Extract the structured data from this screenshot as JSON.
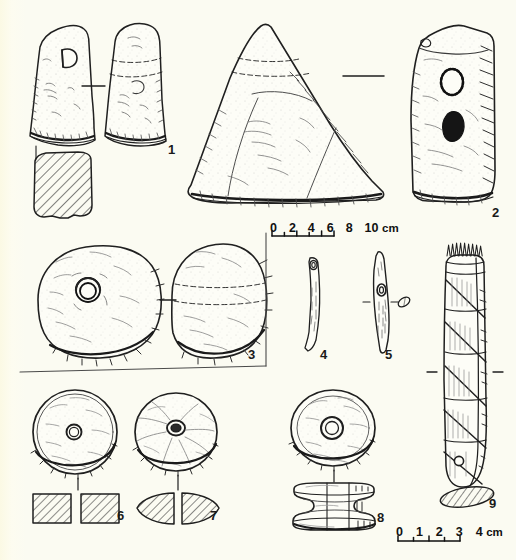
{
  "plate": {
    "title": "Plate of stone and bone artefacts",
    "background_color": "#fbfbf2",
    "ink_color": "#1f1f1f",
    "width": 516,
    "height": 560
  },
  "figure_numbers": [
    {
      "label": "1",
      "x": 168,
      "y": 143,
      "of": "stone-adze"
    },
    {
      "label": "2",
      "x": 492,
      "y": 206,
      "of": "perforated-stone-slab"
    },
    {
      "label": "3",
      "x": 248,
      "y": 348,
      "of": "perforated-stone-disc"
    },
    {
      "label": "4",
      "x": 320,
      "y": 348,
      "of": "bone-needle-long"
    },
    {
      "label": "5",
      "x": 385,
      "y": 348,
      "of": "bone-needle-eyed"
    },
    {
      "label": "6",
      "x": 117,
      "y": 509,
      "of": "spindle-whorl-flat"
    },
    {
      "label": "7",
      "x": 210,
      "y": 509,
      "of": "spindle-whorl-biconical"
    },
    {
      "label": "8",
      "x": 377,
      "y": 511,
      "of": "spool-whorl-grooved"
    },
    {
      "label": "9",
      "x": 489,
      "y": 497,
      "of": "bone-comb-weaving-tool"
    }
  ],
  "scale_bars": [
    {
      "name": "scale-bar-10cm",
      "ticks": [
        "0",
        "2",
        "4",
        "6",
        "8",
        "10"
      ],
      "unit": "cm",
      "x": 270,
      "y": 222,
      "bar_length_px": 62,
      "applies_to": "items 1-3 and the large triangular grinding stone"
    },
    {
      "name": "scale-bar-4cm",
      "ticks": [
        "0",
        "1",
        "2",
        "3",
        "4"
      ],
      "unit": "cm",
      "x": 396,
      "y": 526,
      "bar_length_px": 62,
      "applies_to": "items 4-9"
    }
  ],
  "objects": [
    {
      "id": "stone-adze",
      "name": "Stone adze / axe head",
      "views": [
        "face view",
        "side view",
        "cross-section (hatched)"
      ],
      "number": "1"
    },
    {
      "id": "triangular-grinding-stone",
      "name": "Large triangular grinding stone",
      "views": [
        "face view"
      ],
      "number": ""
    },
    {
      "id": "perforated-stone-slab",
      "name": "Rectangular stone slab with two perforations",
      "views": [
        "face view"
      ],
      "number": "2"
    },
    {
      "id": "perforated-stone-disc",
      "name": "Large perforated stone disc",
      "views": [
        "face view",
        "profile view"
      ],
      "number": "3"
    },
    {
      "id": "bone-needle-long",
      "name": "Bone needle with eye",
      "views": [
        "face view"
      ],
      "number": "4"
    },
    {
      "id": "bone-needle-eyed",
      "name": "Bone needle with central eye",
      "views": [
        "face view",
        "cross-section (hatched)"
      ],
      "number": "5"
    },
    {
      "id": "spindle-whorl-flat",
      "name": "Flat perforated spindle whorl",
      "views": [
        "face view",
        "cross-section (hatched)"
      ],
      "number": "6"
    },
    {
      "id": "spindle-whorl-biconical",
      "name": "Biconical spindle whorl",
      "views": [
        "face view",
        "cross-section (hatched)"
      ],
      "number": "7"
    },
    {
      "id": "spool-whorl-grooved",
      "name": "Grooved spool-shaped whorl",
      "views": [
        "top view",
        "profile view"
      ],
      "number": "8"
    },
    {
      "id": "bone-comb-weaving-tool",
      "name": "Bone comb / weaving tool with bound shaft",
      "views": [
        "face view",
        "cross-section (hatched)"
      ],
      "number": "9"
    }
  ]
}
